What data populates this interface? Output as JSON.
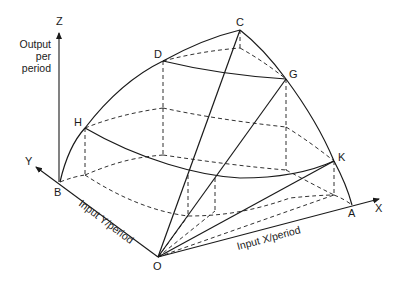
{
  "diagram": {
    "type": "3D production surface diagram",
    "axes": {
      "z": {
        "label": "Z",
        "title_lines": [
          "Output",
          "per",
          "period"
        ]
      },
      "y": {
        "label": "Y",
        "title": "Input Y/period"
      },
      "x": {
        "label": "X",
        "title": "Input X/period"
      }
    },
    "points": {
      "O": "O",
      "A": "A",
      "B": "B",
      "C": "C",
      "D": "D",
      "G": "G",
      "H": "H",
      "K": "K"
    },
    "colors": {
      "stroke": "#1a1a1a",
      "background": "#ffffff"
    }
  }
}
